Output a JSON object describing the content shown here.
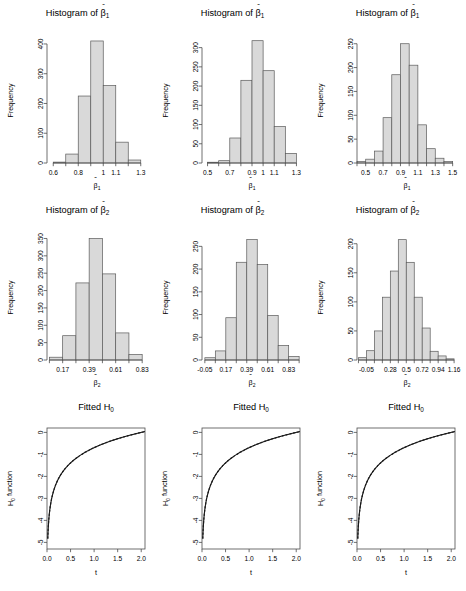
{
  "figure": {
    "rows": 3,
    "cols": 3,
    "background": "#ffffff",
    "bar_fill": "#d9d9d9",
    "bar_stroke": "#5a5a5a",
    "axis_color": "#4d4d4d",
    "curve_color": "#1a1a1a"
  },
  "chart_data": [
    {
      "id": "hist-beta1-a",
      "type": "bar",
      "title": "Histogram of β̂1",
      "title_base": "Histogram of",
      "title_symbol": "β",
      "title_sub": "1",
      "xlabel": "β̂1",
      "xlabel_symbol": "β",
      "xlabel_sub": "1",
      "ylabel": "Frequency",
      "categories": [
        "0.6-0.7",
        "0.7-0.8",
        "0.8-0.9",
        "0.9-1.0",
        "1.0-1.1",
        "1.1-1.2",
        "1.2-1.3"
      ],
      "bin_edges": [
        0.6,
        0.7,
        0.8,
        0.9,
        1.0,
        1.1,
        1.2,
        1.3
      ],
      "values": [
        3,
        30,
        225,
        410,
        260,
        70,
        10
      ],
      "xticks": [
        "0.6",
        "0.8",
        "1",
        "1.1",
        "1.3"
      ],
      "xtick_values": [
        0.6,
        0.8,
        1.0,
        1.1,
        1.3
      ],
      "yticks": [
        "0",
        "100",
        "200",
        "300",
        "400"
      ],
      "ytick_values": [
        0,
        100,
        200,
        300,
        400
      ],
      "xlim": [
        0.55,
        1.35
      ],
      "ylim": [
        0,
        420
      ],
      "grid": false
    },
    {
      "id": "hist-beta1-b",
      "type": "bar",
      "title": "Histogram of β̂1",
      "title_base": "Histogram of",
      "title_symbol": "β",
      "title_sub": "1",
      "xlabel": "β̂1",
      "xlabel_symbol": "β",
      "xlabel_sub": "1",
      "ylabel": "Frequency",
      "categories": [
        "0.5-0.6",
        "0.6-0.7",
        "0.7-0.8",
        "0.8-0.9",
        "0.9-1.0",
        "1.0-1.1",
        "1.1-1.2",
        "1.2-1.3"
      ],
      "bin_edges": [
        0.5,
        0.6,
        0.7,
        0.8,
        0.9,
        1.0,
        1.1,
        1.2,
        1.3
      ],
      "values": [
        2,
        6,
        65,
        215,
        318,
        240,
        95,
        25
      ],
      "xticks": [
        "0.5",
        "0.7",
        "0.9",
        "1",
        "1.1",
        "1.3"
      ],
      "xtick_values": [
        0.5,
        0.7,
        0.9,
        1.0,
        1.1,
        1.3
      ],
      "yticks": [
        "0",
        "50",
        "100",
        "150",
        "200",
        "250",
        "300"
      ],
      "ytick_values": [
        0,
        50,
        100,
        150,
        200,
        250,
        300
      ],
      "xlim": [
        0.45,
        1.35
      ],
      "ylim": [
        0,
        325
      ],
      "grid": false
    },
    {
      "id": "hist-beta1-c",
      "type": "bar",
      "title": "Histogram of β̂1",
      "title_base": "Histogram of",
      "title_symbol": "β",
      "title_sub": "1",
      "xlabel": "β̂1",
      "xlabel_symbol": "β",
      "xlabel_sub": "1",
      "ylabel": "Frequency",
      "categories": [
        "0.4-0.5",
        "0.5-0.6",
        "0.6-0.7",
        "0.7-0.8",
        "0.8-0.9",
        "0.9-1.0",
        "1.0-1.1",
        "1.1-1.2",
        "1.2-1.3",
        "1.3-1.4",
        "1.4-1.5"
      ],
      "bin_edges": [
        0.4,
        0.5,
        0.6,
        0.7,
        0.8,
        0.9,
        1.0,
        1.1,
        1.2,
        1.3,
        1.4,
        1.5
      ],
      "values": [
        3,
        8,
        25,
        95,
        185,
        250,
        205,
        80,
        30,
        10,
        3
      ],
      "xticks": [
        "0.5",
        "0.7",
        "0.9",
        "1.1",
        "1.3",
        "1.5"
      ],
      "xtick_values": [
        0.5,
        0.7,
        0.9,
        1.1,
        1.3,
        1.5
      ],
      "yticks": [
        "0",
        "50",
        "100",
        "150",
        "200",
        "250"
      ],
      "ytick_values": [
        0,
        50,
        100,
        150,
        200,
        250
      ],
      "xlim": [
        0.4,
        1.55
      ],
      "ylim": [
        0,
        262
      ],
      "grid": false
    },
    {
      "id": "hist-beta2-a",
      "type": "bar",
      "title": "Histogram of β̂2",
      "title_base": "Histogram of",
      "title_symbol": "β",
      "title_sub": "2",
      "xlabel": "β̂2",
      "xlabel_symbol": "β",
      "xlabel_sub": "2",
      "ylabel": "Frequency",
      "categories": [
        "0.06-0.17",
        "0.17-0.28",
        "0.28-0.39",
        "0.39-0.50",
        "0.50-0.61",
        "0.61-0.72",
        "0.72-0.83"
      ],
      "bin_edges": [
        0.06,
        0.17,
        0.28,
        0.39,
        0.5,
        0.61,
        0.72,
        0.83
      ],
      "values": [
        8,
        70,
        222,
        350,
        248,
        78,
        16
      ],
      "xticks": [
        "0.17",
        "0.39",
        "0.61",
        "0.83"
      ],
      "xtick_values": [
        0.17,
        0.39,
        0.61,
        0.83
      ],
      "yticks": [
        "0",
        "50",
        "100",
        "150",
        "200",
        "250",
        "300",
        "350"
      ],
      "ytick_values": [
        0,
        50,
        100,
        150,
        200,
        250,
        300,
        350
      ],
      "xlim": [
        0.04,
        0.87
      ],
      "ylim": [
        0,
        360
      ],
      "grid": false
    },
    {
      "id": "hist-beta2-b",
      "type": "bar",
      "title": "Histogram of β̂2",
      "title_base": "Histogram of",
      "title_symbol": "β",
      "title_sub": "2",
      "xlabel": "β̂2",
      "xlabel_symbol": "β",
      "xlabel_sub": "2",
      "ylabel": "Frequency",
      "categories": [
        "-0.05-0.06",
        "0.06-0.17",
        "0.17-0.28",
        "0.28-0.39",
        "0.39-0.50",
        "0.50-0.61",
        "0.61-0.72",
        "0.72-0.83",
        "0.83-0.94"
      ],
      "bin_edges": [
        -0.05,
        0.06,
        0.17,
        0.28,
        0.39,
        0.5,
        0.61,
        0.72,
        0.83,
        0.94
      ],
      "values": [
        5,
        20,
        93,
        215,
        265,
        210,
        98,
        32,
        8
      ],
      "xticks": [
        "-0.05",
        "0.17",
        "0.39",
        "0.61",
        "0.83"
      ],
      "xtick_values": [
        -0.05,
        0.17,
        0.39,
        0.61,
        0.83
      ],
      "yticks": [
        "0",
        "50",
        "100",
        "150",
        "200",
        "250"
      ],
      "ytick_values": [
        0,
        50,
        100,
        150,
        200,
        250
      ],
      "xlim": [
        -0.08,
        0.97
      ],
      "ylim": [
        0,
        275
      ],
      "grid": false
    },
    {
      "id": "hist-beta2-c",
      "type": "bar",
      "title": "Histogram of β̂2",
      "title_base": "Histogram of",
      "title_symbol": "β",
      "title_sub": "2",
      "xlabel": "β̂2",
      "xlabel_symbol": "β",
      "xlabel_sub": "2",
      "ylabel": "Frequency",
      "categories": [
        "-0.05-0.06",
        "0.06-0.17",
        "0.17-0.28",
        "0.28-0.39",
        "0.39-0.50",
        "0.50-0.61",
        "0.61-0.72",
        "0.72-0.83",
        "0.83-0.94",
        "0.94-1.05",
        "1.05-1.16"
      ],
      "bin_edges": [
        -0.16,
        -0.05,
        0.06,
        0.17,
        0.28,
        0.39,
        0.5,
        0.61,
        0.72,
        0.83,
        0.94,
        1.05,
        1.16
      ],
      "values": [
        4,
        16,
        50,
        108,
        153,
        207,
        168,
        108,
        55,
        15,
        7,
        2
      ],
      "xticks": [
        "-0.05",
        "0.28",
        "0.5",
        "0.72",
        "0.94",
        "1.16"
      ],
      "xtick_values": [
        -0.05,
        0.28,
        0.5,
        0.72,
        0.94,
        1.16
      ],
      "yticks": [
        "0",
        "50",
        "100",
        "150",
        "200"
      ],
      "ytick_values": [
        0,
        50,
        100,
        150,
        200
      ],
      "xlim": [
        -0.18,
        1.2
      ],
      "ylim": [
        0,
        215
      ],
      "grid": false
    },
    {
      "id": "fitted-h0-a",
      "type": "line",
      "title": "Fitted H0",
      "title_base": "Fitted H",
      "title_sub": "0",
      "xlabel": "t",
      "ylabel": "H0 function",
      "ylabel_base": "H",
      "ylabel_sub": "0",
      "ylabel_tail": " function",
      "xticks": [
        "0.0",
        "0.5",
        "1.0",
        "1.5",
        "2.0"
      ],
      "xtick_values": [
        0.0,
        0.5,
        1.0,
        1.5,
        2.0
      ],
      "yticks": [
        "0",
        "-1",
        "-2",
        "-3",
        "-4",
        "-5"
      ],
      "ytick_values": [
        0,
        -1,
        -2,
        -3,
        -4,
        -5
      ],
      "xlim": [
        0.0,
        2.08
      ],
      "ylim": [
        -5.3,
        0.2
      ],
      "function": "log(t/2)",
      "grid": false,
      "series": [
        {
          "name": "fitted",
          "style": "dashed"
        },
        {
          "name": "true",
          "style": "solid"
        }
      ]
    },
    {
      "id": "fitted-h0-b",
      "type": "line",
      "title": "Fitted H0",
      "title_base": "Fitted H",
      "title_sub": "0",
      "xlabel": "t",
      "ylabel": "H0 function",
      "ylabel_base": "H",
      "ylabel_sub": "0",
      "ylabel_tail": " function",
      "xticks": [
        "0.0",
        "0.5",
        "1.0",
        "1.5",
        "2.0"
      ],
      "xtick_values": [
        0.0,
        0.5,
        1.0,
        1.5,
        2.0
      ],
      "yticks": [
        "0",
        "-1",
        "-2",
        "-3",
        "-4",
        "-5"
      ],
      "ytick_values": [
        0,
        -1,
        -2,
        -3,
        -4,
        -5
      ],
      "xlim": [
        0.0,
        2.08
      ],
      "ylim": [
        -5.3,
        0.2
      ],
      "function": "log(t/2)",
      "grid": false,
      "series": [
        {
          "name": "fitted",
          "style": "dashed"
        },
        {
          "name": "true",
          "style": "solid"
        }
      ]
    },
    {
      "id": "fitted-h0-c",
      "type": "line",
      "title": "Fitted H0",
      "title_base": "Fitted H",
      "title_sub": "0",
      "xlabel": "t",
      "ylabel": "H0 function",
      "ylabel_base": "H",
      "ylabel_sub": "0",
      "ylabel_tail": " function",
      "xticks": [
        "0.0",
        "0.5",
        "1.0",
        "1.5",
        "2.0"
      ],
      "xtick_values": [
        0.0,
        0.5,
        1.0,
        1.5,
        2.0
      ],
      "yticks": [
        "0",
        "-1",
        "-2",
        "-3",
        "-4",
        "-5"
      ],
      "ytick_values": [
        0,
        -1,
        -2,
        -3,
        -4,
        -5
      ],
      "xlim": [
        0.0,
        2.08
      ],
      "ylim": [
        -5.3,
        0.2
      ],
      "function": "log(t/2)",
      "grid": false,
      "series": [
        {
          "name": "fitted",
          "style": "dashed"
        },
        {
          "name": "true",
          "style": "solid"
        }
      ]
    }
  ]
}
